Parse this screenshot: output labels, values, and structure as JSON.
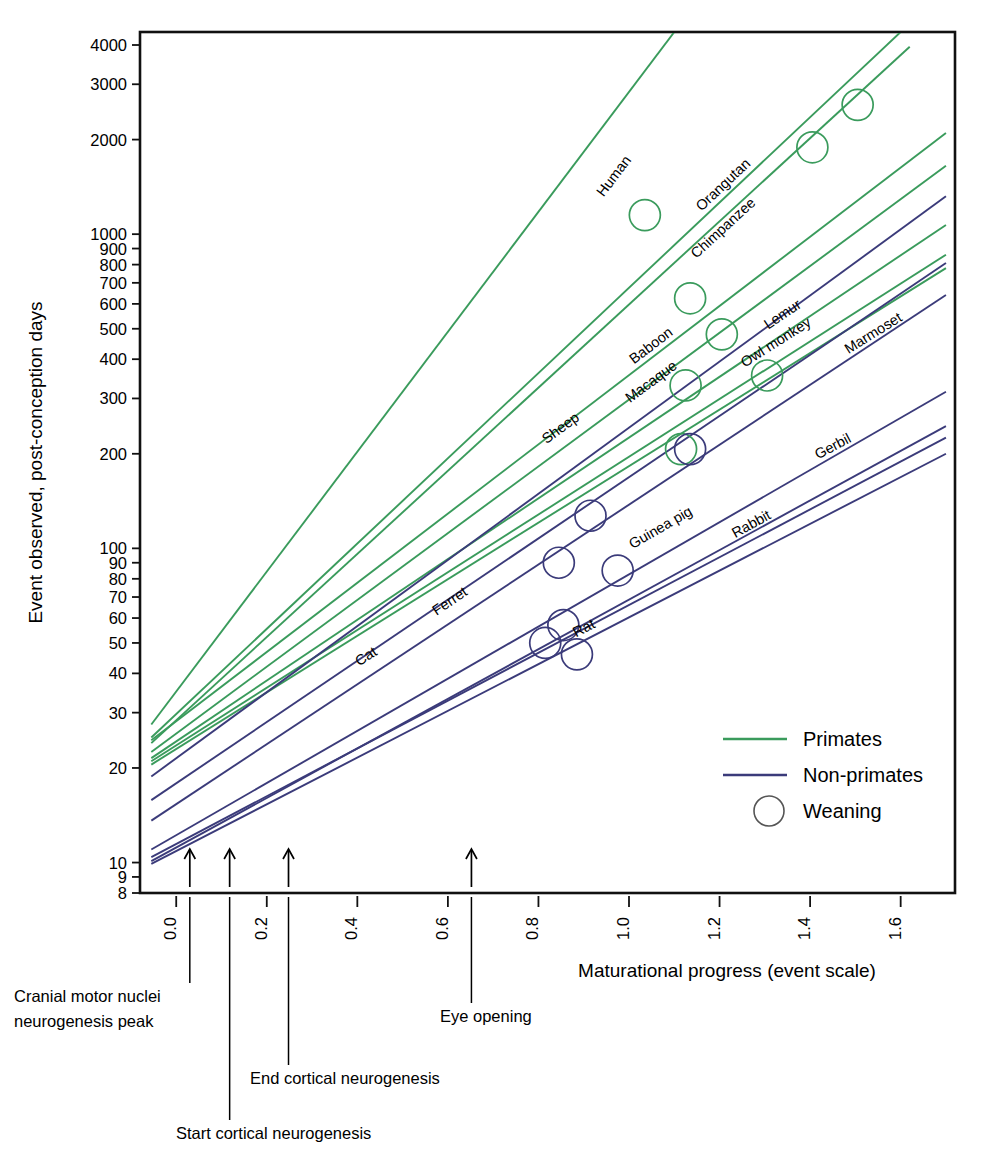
{
  "chart_data": {
    "type": "line",
    "title": "",
    "xlabel": "Maturational progress (event scale)",
    "ylabel": "Event observed, post-conception days",
    "yscale": "log",
    "xlim": [
      -0.08,
      1.72
    ],
    "ylim": [
      8,
      4400
    ],
    "grid": false,
    "legend_position": "lower-right",
    "xticks": [
      "0.0",
      "0.2",
      "0.4",
      "0.6",
      "0.8",
      "1.0",
      "1.2",
      "1.4",
      "1.6"
    ],
    "xtick_values": [
      0.0,
      0.2,
      0.4,
      0.6,
      0.8,
      1.0,
      1.2,
      1.4,
      1.6
    ],
    "yticks": [
      "8",
      "9",
      "10",
      "20",
      "30",
      "40",
      "50",
      "60",
      "70",
      "80",
      "90",
      "100",
      "200",
      "300",
      "400",
      "500",
      "600",
      "700",
      "800",
      "900",
      "1000",
      "2000",
      "3000",
      "4000"
    ],
    "ytick_values": [
      8,
      9,
      10,
      20,
      30,
      40,
      50,
      60,
      70,
      80,
      90,
      100,
      200,
      300,
      400,
      500,
      600,
      700,
      800,
      900,
      1000,
      2000,
      3000,
      4000
    ],
    "legend": [
      {
        "label": "Primates",
        "color": "#3a9b5c",
        "marker": "line"
      },
      {
        "label": "Non-primates",
        "color": "#3b3b7a",
        "marker": "line"
      },
      {
        "label": "Weaning",
        "color": "#3b3b7a",
        "marker": "circle"
      }
    ],
    "series": [
      {
        "name": "Human",
        "group": "Primates",
        "color": "#3a9b5c",
        "x0": -0.055,
        "y0": 27.5,
        "x1": 1.1,
        "y1": 4400,
        "label_x": 0.975,
        "label_y": 1500,
        "weaning": {
          "x": 1.035,
          "y": 1150
        }
      },
      {
        "name": "Orangutan",
        "group": "Primates",
        "color": "#3a9b5c",
        "x0": -0.055,
        "y0": 25.0,
        "x1": 1.6,
        "y1": 4400,
        "label_x": 1.215,
        "label_y": 1400,
        "weaning": {
          "x": 1.505,
          "y": 2580
        }
      },
      {
        "name": "Chimpanzee",
        "group": "Primates",
        "color": "#3a9b5c",
        "x0": -0.055,
        "y0": 24.0,
        "x1": 1.62,
        "y1": 3950,
        "label_x": 1.215,
        "label_y": 1020,
        "weaning": {
          "x": 1.405,
          "y": 1890
        }
      },
      {
        "name": "Baboon",
        "group": "Primates",
        "color": "#3a9b5c",
        "x0": -0.055,
        "y0": 24.5,
        "x1": 1.7,
        "y1": 2100,
        "label_x": 1.055,
        "label_y": 430,
        "weaning": {
          "x": 1.135,
          "y": 625
        }
      },
      {
        "name": "Macaque",
        "group": "Primates",
        "color": "#3a9b5c",
        "x0": -0.055,
        "y0": 22.5,
        "x1": 1.7,
        "y1": 1650,
        "label_x": 1.055,
        "label_y": 330,
        "weaning": {
          "x": 1.205,
          "y": 480
        }
      },
      {
        "name": "Lemur",
        "group": "Primates",
        "color": "#3a9b5c",
        "x0": -0.055,
        "y0": 21.5,
        "x1": 1.7,
        "y1": 1070,
        "label_x": 1.345,
        "label_y": 540,
        "weaning": {
          "x": 1.305,
          "y": 355
        }
      },
      {
        "name": "Owl monkey",
        "group": "Primates",
        "color": "#3a9b5c",
        "x0": -0.055,
        "y0": 21.0,
        "x1": 1.7,
        "y1": 860,
        "label_x": 1.33,
        "label_y": 440,
        "weaning": {
          "x": 1.125,
          "y": 330
        }
      },
      {
        "name": "Marmoset",
        "group": "Primates",
        "color": "#3a9b5c",
        "x0": -0.055,
        "y0": 20.5,
        "x1": 1.7,
        "y1": 780,
        "label_x": 1.545,
        "label_y": 470,
        "weaning": {
          "x": 1.115,
          "y": 207
        }
      },
      {
        "name": "Sheep",
        "group": "Non-primates",
        "color": "#3b3b7a",
        "x0": -0.055,
        "y0": 18.8,
        "x1": 1.7,
        "y1": 1320,
        "label_x": 0.855,
        "label_y": 235,
        "weaning": {
          "x": 1.135,
          "y": 207
        }
      },
      {
        "name": "Ferret",
        "group": "Non-primates",
        "color": "#3b3b7a",
        "x0": -0.055,
        "y0": 15.8,
        "x1": 1.7,
        "y1": 810,
        "label_x": 0.61,
        "label_y": 66,
        "weaning": {
          "x": 0.915,
          "y": 127
        }
      },
      {
        "name": "Cat",
        "group": "Non-primates",
        "color": "#3b3b7a",
        "x0": -0.055,
        "y0": 13.6,
        "x1": 1.7,
        "y1": 640,
        "label_x": 0.425,
        "label_y": 44,
        "weaning": {
          "x": 0.845,
          "y": 90
        }
      },
      {
        "name": "Guinea pig",
        "group": "Non-primates",
        "color": "#3b3b7a",
        "x0": -0.055,
        "y0": 11.0,
        "x1": 1.7,
        "y1": 315,
        "label_x": 1.075,
        "label_y": 113,
        "weaning": {
          "x": 0.975,
          "y": 85
        }
      },
      {
        "name": "Rabbit",
        "group": "Non-primates",
        "color": "#3b3b7a",
        "x0": -0.055,
        "y0": 10.1,
        "x1": 1.7,
        "y1": 245,
        "label_x": 1.275,
        "label_y": 116,
        "weaning": {
          "x": 0.815,
          "y": 50
        }
      },
      {
        "name": "Gerbil",
        "group": "Non-primates",
        "color": "#3b3b7a",
        "x0": -0.055,
        "y0": 10.4,
        "x1": 1.7,
        "y1": 225,
        "label_x": 1.455,
        "label_y": 205,
        "weaning": {
          "x": 0.855,
          "y": 57
        }
      },
      {
        "name": "Rat",
        "group": "Non-primates",
        "color": "#3b3b7a",
        "x0": -0.055,
        "y0": 9.9,
        "x1": 1.7,
        "y1": 200,
        "label_x": 0.905,
        "label_y": 54,
        "weaning": {
          "x": 0.885,
          "y": 46
        }
      }
    ],
    "annotations": [
      {
        "label": "Cranial motor nuclei\nneurogenesis peak",
        "line1": "Cranial motor nuclei",
        "line2": "neurogenesis peak",
        "x": 0.03,
        "text_x": 14,
        "text_y": 1002
      },
      {
        "label": "Start cortical neurogenesis",
        "line1": "Start cortical neurogenesis",
        "line2": "",
        "x": 0.118,
        "text_x": 176,
        "text_y": 1139
      },
      {
        "label": "End cortical neurogenesis",
        "line1": "End cortical neurogenesis",
        "line2": "",
        "x": 0.248,
        "text_x": 250,
        "text_y": 1084
      },
      {
        "label": "Eye opening",
        "line1": "Eye opening",
        "line2": "",
        "x": 0.652,
        "text_x": 440,
        "text_y": 1022
      }
    ]
  }
}
